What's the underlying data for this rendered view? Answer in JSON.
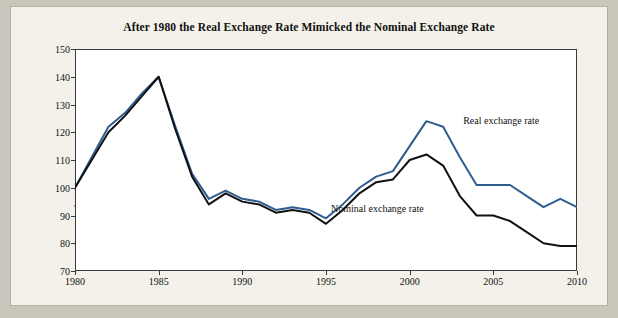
{
  "figure": {
    "title": "After 1980 the Real Exchange Rate Mimicked the Nominal Exchange Rate",
    "ylabel": "Percent of 1980 value",
    "annotations": {
      "real": "Real exchange rate",
      "nominal": "Nominal exchange rate"
    }
  },
  "colors": {
    "real": "#2f5c8f",
    "nominal": "#111111",
    "axis": "#3a3a3a",
    "plot_bg": "#ffffff",
    "figure_bg": "#f3f1e9",
    "page_bg": "#c9c6bb"
  },
  "chart_data": {
    "type": "line",
    "title": "After 1980 the Real Exchange Rate Mimicked the Nominal Exchange Rate",
    "xlabel": "",
    "ylabel": "Percent of 1980 value",
    "xlim": [
      1980,
      2010
    ],
    "ylim": [
      70,
      150
    ],
    "grid": false,
    "legend": "inline-annotations",
    "xticks": [
      1980,
      1985,
      1990,
      1995,
      2000,
      2005,
      2010
    ],
    "yticks": [
      70,
      80,
      90,
      100,
      110,
      120,
      130,
      140,
      150
    ],
    "x": [
      1980,
      1981,
      1982,
      1983,
      1984,
      1985,
      1986,
      1987,
      1988,
      1989,
      1990,
      1991,
      1992,
      1993,
      1994,
      1995,
      1996,
      1997,
      1998,
      1999,
      2000,
      2001,
      2002,
      2003,
      2004,
      2005,
      2006,
      2007,
      2008,
      2009,
      2010
    ],
    "series": [
      {
        "name": "Real exchange rate",
        "color": "#2f5c8f",
        "values": [
          100,
          111,
          122,
          127,
          134,
          140,
          122,
          105,
          96,
          99,
          96,
          95,
          92,
          93,
          92,
          89,
          94,
          100,
          104,
          106,
          115,
          124,
          122,
          111,
          101,
          101,
          101,
          97,
          93,
          96,
          93
        ]
      },
      {
        "name": "Nominal exchange rate",
        "color": "#111111",
        "values": [
          100,
          110,
          120,
          126,
          133,
          140,
          121,
          104,
          94,
          98,
          95,
          94,
          91,
          92,
          91,
          87,
          92,
          98,
          102,
          103,
          110,
          112,
          108,
          97,
          90,
          90,
          88,
          84,
          80,
          79,
          79
        ]
      }
    ]
  }
}
